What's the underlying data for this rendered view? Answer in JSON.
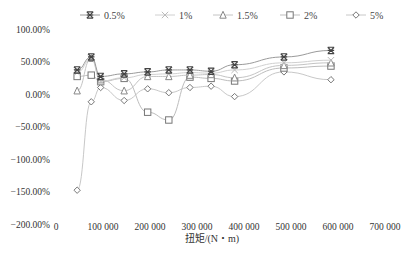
{
  "chart_data": {
    "type": "line",
    "title": "",
    "xlabel": "扭矩/(N・m)",
    "ylabel": "",
    "xlim": [
      0,
      700000
    ],
    "ylim": [
      -200,
      100
    ],
    "x_ticks": [
      "0",
      "100 000",
      "200 000",
      "300 000",
      "400 000",
      "500 000",
      "600 000",
      "700 000"
    ],
    "y_ticks": [
      "100.00%",
      "50.00%",
      "0.00%",
      "-50.00%",
      "-100.00%",
      "-150.00%",
      "-200.00%"
    ],
    "grid": false,
    "legend_position": "top",
    "x": [
      45000,
      75000,
      95000,
      145000,
      195000,
      240000,
      285000,
      330000,
      380000,
      485000,
      585000
    ],
    "series": [
      {
        "name": "0.5%",
        "marker": "asterisk",
        "values": [
          37,
          57,
          27,
          31,
          34,
          37,
          37,
          35,
          45,
          57,
          67
        ]
      },
      {
        "name": "1%",
        "marker": "x",
        "values": [
          33,
          54,
          20,
          25,
          30,
          31,
          33,
          32,
          37,
          48,
          52
        ]
      },
      {
        "name": "1.5%",
        "marker": "triangle",
        "values": [
          5,
          55,
          22,
          5,
          27,
          27,
          29,
          30,
          25,
          44,
          48
        ]
      },
      {
        "name": "2%",
        "marker": "square",
        "values": [
          27,
          29,
          19,
          24,
          -28,
          -40,
          26,
          24,
          20,
          40,
          43
        ]
      },
      {
        "name": "5%",
        "marker": "diamond",
        "values": [
          -148,
          -12,
          10,
          -10,
          8,
          2,
          10,
          12,
          -4,
          34,
          22
        ]
      }
    ]
  },
  "legend": [
    {
      "label": "0.5%"
    },
    {
      "label": "1%"
    },
    {
      "label": "1.5%"
    },
    {
      "label": "2%"
    },
    {
      "label": "5%"
    }
  ]
}
